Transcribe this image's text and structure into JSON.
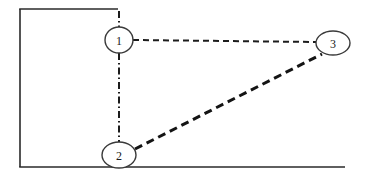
{
  "diagram": {
    "title": "Three node network diagram",
    "background_color": "#ffffff",
    "width": 367,
    "height": 179,
    "frame": {
      "name": "open-rectangle-frame",
      "stroke_color": "#2a2a2a",
      "stroke_width": 1.6,
      "segments": [
        {
          "name": "left-border",
          "x1": 20,
          "y1": 9,
          "x2": 20,
          "y2": 167
        },
        {
          "name": "top-border",
          "x1": 20,
          "y1": 9,
          "x2": 118,
          "y2": 9
        },
        {
          "name": "bottom-border",
          "x1": 20,
          "y1": 167,
          "x2": 345,
          "y2": 167
        }
      ]
    },
    "nodes": [
      {
        "id": "node-1",
        "label": "1",
        "cx": 119,
        "cy": 40,
        "rx": 14,
        "ry": 13,
        "fill": "#ffffff",
        "stroke": "#3a3a3a"
      },
      {
        "id": "node-2",
        "label": "2",
        "cx": 119,
        "cy": 155,
        "rx": 17,
        "ry": 13,
        "fill": "#ffffff",
        "stroke": "#3a3a3a"
      },
      {
        "id": "node-3",
        "label": "3",
        "cx": 333,
        "cy": 43,
        "rx": 17,
        "ry": 12,
        "fill": "#ffffff",
        "stroke": "#3a3a3a"
      }
    ],
    "edges": [
      {
        "id": "edge-1-3",
        "from": "node-1",
        "to": "node-3",
        "style": "dashed",
        "dash_pattern": "6 4",
        "stroke_width": 2.0,
        "color": "#1c1c1c",
        "x1": 133,
        "y1": 40,
        "x2": 316,
        "y2": 42
      },
      {
        "id": "edge-1-2",
        "from": "node-1",
        "to": "node-2",
        "style": "dash-dot",
        "dash_pattern": "7 3 1.5 3",
        "stroke_width": 2.0,
        "color": "#1c1c1c",
        "x1": 119,
        "y1": 53,
        "x2": 119,
        "y2": 142
      },
      {
        "id": "edge-2-3",
        "from": "node-2",
        "to": "node-3",
        "style": "dashed",
        "dash_pattern": "8 5",
        "stroke_width": 3.0,
        "color": "#141414",
        "x1": 135,
        "y1": 149,
        "x2": 322,
        "y2": 54
      },
      {
        "id": "edge-1-top-stub",
        "from": "node-1",
        "to": "top-border",
        "style": "dash-dot",
        "dash_pattern": "7 3 1.5 3",
        "stroke_width": 2.0,
        "color": "#1c1c1c",
        "x1": 119,
        "y1": 12,
        "x2": 119,
        "y2": 27
      }
    ]
  }
}
